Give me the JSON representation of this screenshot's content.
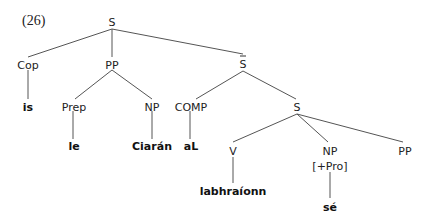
{
  "example_number": "(26)",
  "tree": {
    "root": {
      "label": "S"
    },
    "cop": {
      "label": "Cop",
      "word": "is"
    },
    "pp": {
      "label": "PP",
      "prep": {
        "label": "Prep",
        "word": "le"
      },
      "np": {
        "label": "NP",
        "word": "Ciarán"
      }
    },
    "sbar": {
      "label": "S",
      "bar": true,
      "comp": {
        "label": "COMP",
        "word": "aL"
      },
      "s": {
        "label": "S",
        "v": {
          "label": "V",
          "word": "labhraíonn"
        },
        "np": {
          "label": "NP",
          "feature": "[+Pro]",
          "word": "sé"
        },
        "pp": {
          "label": "PP"
        }
      }
    }
  }
}
